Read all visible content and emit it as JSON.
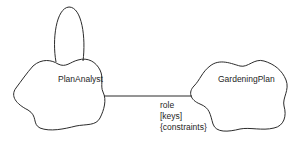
{
  "diagram": {
    "notation": "Booch class diagram",
    "classes": [
      {
        "id": "plananalyst",
        "name": "PlanAnalyst"
      },
      {
        "id": "gardeningplan",
        "name": "GardeningPlan"
      }
    ],
    "association": {
      "from": "PlanAnalyst",
      "to": "GardeningPlan",
      "adornments": {
        "role": "role",
        "keys": "[keys]",
        "constraints": "{constraints}"
      }
    },
    "self_association": {
      "on": "PlanAnalyst"
    },
    "colors": {
      "stroke": "#2b2b2b",
      "text": "#1e1e1e",
      "background": "#ffffff"
    }
  }
}
